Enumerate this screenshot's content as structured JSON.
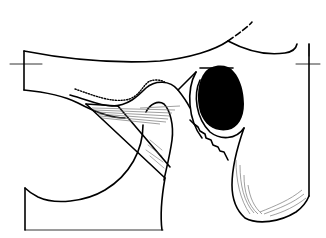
{
  "figure": {
    "type": "anatomical line drawing",
    "colors": {
      "line": "#000000",
      "fill": "#000000",
      "hatch": "#777777",
      "background": "#ffffff"
    },
    "markers": [
      {
        "name": "left-crosshair",
        "x": 24,
        "y": 64
      },
      {
        "name": "right-crosshair",
        "x": 309,
        "y": 64
      }
    ]
  }
}
